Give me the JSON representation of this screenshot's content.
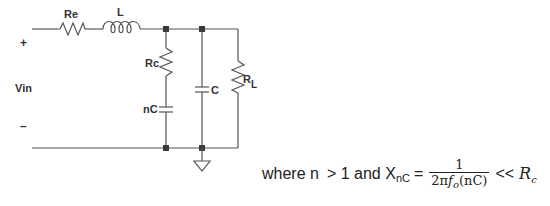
{
  "circuit": {
    "labels": {
      "re": "Re",
      "l": "L",
      "rc": "Rc",
      "nc": "nC",
      "c": "C",
      "rl_main": "R",
      "rl_sub": "L",
      "vin": "Vin",
      "plus": "+",
      "minus": "–"
    },
    "components": [
      {
        "id": "Re",
        "type": "resistor",
        "branch": "series"
      },
      {
        "id": "L",
        "type": "inductor",
        "branch": "series"
      },
      {
        "id": "Rc",
        "type": "resistor",
        "branch": "shunt-1"
      },
      {
        "id": "nC",
        "type": "capacitor",
        "branch": "shunt-1"
      },
      {
        "id": "C",
        "type": "capacitor",
        "branch": "shunt-2"
      },
      {
        "id": "RL",
        "type": "resistor",
        "branch": "load"
      }
    ],
    "ground_icon": "ground-icon"
  },
  "formula": {
    "prefix": "where n",
    "condition": "> 1 and X",
    "x_sub": "nC",
    "equals": "=",
    "numerator": "1",
    "den_prefix": "2π",
    "den_f": "f",
    "den_f_sub": "o",
    "den_suffix": "(nC)",
    "relation": "<<",
    "rhs": "R",
    "rhs_sub": "c"
  }
}
